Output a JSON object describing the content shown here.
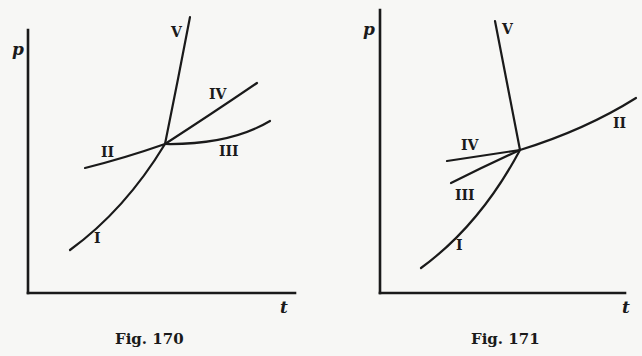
{
  "figures": [
    {
      "caption": "Fig. 170",
      "y_axis_label": "p",
      "x_axis_label": "t",
      "curves": [
        {
          "label": "I"
        },
        {
          "label": "II"
        },
        {
          "label": "III"
        },
        {
          "label": "IV"
        },
        {
          "label": "V"
        }
      ]
    },
    {
      "caption": "Fig. 171",
      "y_axis_label": "p",
      "x_axis_label": "t",
      "curves": [
        {
          "label": "I"
        },
        {
          "label": "II"
        },
        {
          "label": "III"
        },
        {
          "label": "IV"
        },
        {
          "label": "V"
        }
      ]
    }
  ],
  "colors": {
    "ink": "#1a1a1a",
    "paper": "#f7f7f5"
  }
}
